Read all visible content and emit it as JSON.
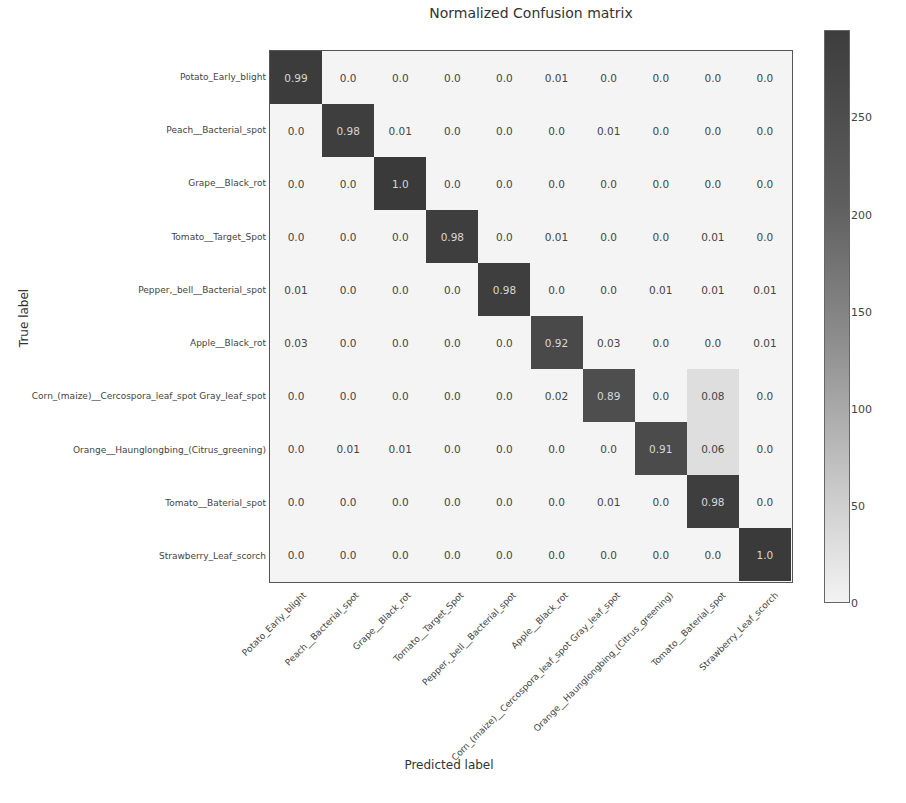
{
  "chart_data": {
    "type": "heatmap",
    "title": "Normalized Confusion matrix",
    "xlabel": "Predicted label",
    "ylabel": "True label",
    "categories": [
      "Potato_Early_blight",
      "Peach__Bacterial_spot",
      "Grape__Black_rot",
      "Tomato__Target_Spot",
      "Pepper,_bell__Bacterial_spot",
      "Apple__Black_rot",
      "Corn_(maize)__Cercospora_leaf_spot Gray_leaf_spot",
      "Orange__Haunglongbing_(Citrus_greening)",
      "Tomato__Baterial_spot",
      "Strawberry_Leaf_scorch"
    ],
    "matrix": [
      [
        0.99,
        0.0,
        0.0,
        0.0,
        0.0,
        0.01,
        0.0,
        0.0,
        0.0,
        0.0
      ],
      [
        0.0,
        0.98,
        0.01,
        0.0,
        0.0,
        0.0,
        0.01,
        0.0,
        0.0,
        0.0
      ],
      [
        0.0,
        0.0,
        1.0,
        0.0,
        0.0,
        0.0,
        0.0,
        0.0,
        0.0,
        0.0
      ],
      [
        0.0,
        0.0,
        0.0,
        0.98,
        0.0,
        0.01,
        0.0,
        0.0,
        0.01,
        0.0
      ],
      [
        0.01,
        0.0,
        0.0,
        0.0,
        0.98,
        0.0,
        0.0,
        0.01,
        0.01,
        0.01
      ],
      [
        0.03,
        0.0,
        0.0,
        0.0,
        0.0,
        0.92,
        0.03,
        0.0,
        0.0,
        0.01
      ],
      [
        0.0,
        0.0,
        0.0,
        0.0,
        0.0,
        0.02,
        0.89,
        0.0,
        0.08,
        0.0
      ],
      [
        0.0,
        0.01,
        0.01,
        0.0,
        0.0,
        0.0,
        0.0,
        0.91,
        0.06,
        0.0
      ],
      [
        0.0,
        0.0,
        0.0,
        0.0,
        0.0,
        0.0,
        0.01,
        0.0,
        0.98,
        0.0
      ],
      [
        0.0,
        0.0,
        0.0,
        0.0,
        0.0,
        0.0,
        0.0,
        0.0,
        0.0,
        1.0
      ]
    ],
    "colorbar": {
      "ticks": [
        0,
        50,
        100,
        150,
        200,
        250
      ],
      "range": [
        0,
        295
      ],
      "colormap": "greys"
    },
    "grid": false
  },
  "colors": {
    "high": "#3a3a3a",
    "low": "#f3f3f3",
    "text_dark": "#444444",
    "text_light": "#d8d8d8"
  }
}
